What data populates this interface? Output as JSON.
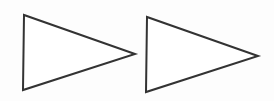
{
  "diagram": {
    "background": "#fdfdfd",
    "stroke_color": "#333333",
    "stroke_width": 2,
    "shapes": [
      {
        "type": "triangle",
        "direction": "right",
        "fill": "#ffffff",
        "points": [
          [
            24,
            15
          ],
          [
            23,
            90
          ],
          [
            135,
            54
          ]
        ]
      },
      {
        "type": "triangle",
        "direction": "right",
        "fill": "#ffffff",
        "points": [
          [
            147,
            17
          ],
          [
            146,
            92
          ],
          [
            258,
            56
          ]
        ]
      }
    ]
  }
}
